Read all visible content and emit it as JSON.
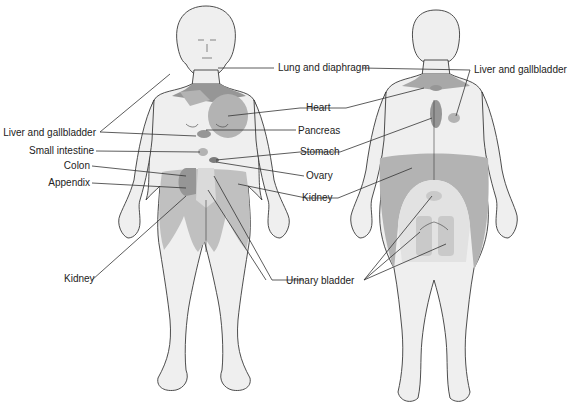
{
  "figure": {
    "colors": {
      "skin": "#efefef",
      "outline": "#3a3a3a",
      "referred_light": "#c9c9c9",
      "referred_mid": "#b3b3b3",
      "referred_dark": "#969696",
      "leader_line": "#333333"
    },
    "views": [
      {
        "name": "anterior",
        "label": ""
      },
      {
        "name": "posterior",
        "label": ""
      }
    ],
    "labels": {
      "lung_and_diaphragm": "Lung and diaphragm",
      "liver_and_gallbladder_front": "Liver and gallbladder",
      "liver_and_gallbladder_back": "Liver and gallbladder",
      "heart": "Heart",
      "pancreas": "Pancreas",
      "small_intestine": "Small intestine",
      "stomach": "Stomach",
      "colon": "Colon",
      "ovary": "Ovary",
      "appendix": "Appendix",
      "kidney_right": "Kidney",
      "kidney_left": "Kidney",
      "urinary_bladder": "Urinary bladder"
    }
  }
}
